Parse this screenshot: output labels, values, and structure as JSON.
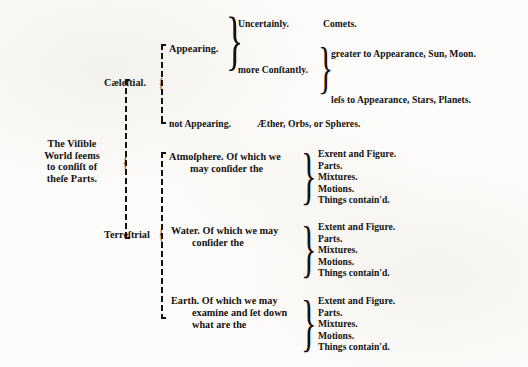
{
  "document": {
    "type": "bracket-taxonomy-diagram",
    "title": "The Visible World seems to consist of these Parts.",
    "root": {
      "lines": [
        "The Viſible",
        "World ſeems",
        "to conſiſt of",
        "theſe Parts."
      ]
    },
    "branches": [
      {
        "label": "Cæleſtial.",
        "children": [
          {
            "label": "Appearing.",
            "children": [
              {
                "label": "Uncertainly.",
                "value": "Comets."
              },
              {
                "label": "more Conſtantly.",
                "children": [
                  {
                    "label": "greater to Appearance, Sun, Moon."
                  },
                  {
                    "label": "leſs to Appearance, Stars, Planets."
                  }
                ]
              }
            ]
          },
          {
            "label": "not Appearing.",
            "value": "Æther, Orbs, or Spheres."
          }
        ]
      },
      {
        "label": "Terreſtrial",
        "children": [
          {
            "label_lines": [
              "Atmoſphere.   Of which we",
              "may conſider the"
            ],
            "items": [
              "Exrent and Figure.",
              "Parts.",
              "Mixtures.",
              "Motions.",
              "Things contain'd."
            ]
          },
          {
            "label_lines": [
              "Water.   Of which we may",
              "conſider the"
            ],
            "items": [
              "Extent and Figure.",
              "Parts.",
              "Mixtures.",
              "Motions.",
              "Things contain'd."
            ]
          },
          {
            "label_lines": [
              "Earth.   Of which we may",
              "examine and ſet down",
              "what are the"
            ],
            "items": [
              "Extent and Figure.",
              "Parts.",
              "Mixtures.",
              "Motions.",
              "Things contain'd."
            ]
          }
        ]
      }
    ],
    "glyphs": {
      "brace": "}",
      "hook": "{"
    },
    "colors": {
      "ink": "#15120f",
      "paper": "#fdfcfa"
    }
  }
}
